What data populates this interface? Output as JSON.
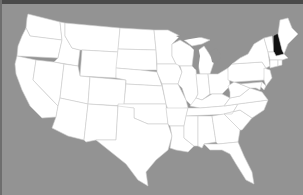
{
  "map": {
    "title": "United States",
    "background_color": "#939393",
    "land_color": "#ffffff",
    "border_color": "#cfcfcf",
    "highlight_color": "#111111",
    "highlighted_state": "New Hampshire",
    "states": [
      {
        "name": "Washington"
      },
      {
        "name": "Oregon"
      },
      {
        "name": "California"
      },
      {
        "name": "Idaho"
      },
      {
        "name": "Nevada"
      },
      {
        "name": "Montana"
      },
      {
        "name": "Wyoming"
      },
      {
        "name": "Utah"
      },
      {
        "name": "Arizona"
      },
      {
        "name": "Colorado"
      },
      {
        "name": "New Mexico"
      },
      {
        "name": "North Dakota"
      },
      {
        "name": "South Dakota"
      },
      {
        "name": "Nebraska"
      },
      {
        "name": "Kansas"
      },
      {
        "name": "Oklahoma"
      },
      {
        "name": "Texas"
      },
      {
        "name": "Minnesota"
      },
      {
        "name": "Iowa"
      },
      {
        "name": "Missouri"
      },
      {
        "name": "Arkansas"
      },
      {
        "name": "Louisiana"
      },
      {
        "name": "Wisconsin"
      },
      {
        "name": "Illinois"
      },
      {
        "name": "Michigan"
      },
      {
        "name": "Indiana"
      },
      {
        "name": "Ohio"
      },
      {
        "name": "Kentucky"
      },
      {
        "name": "Tennessee"
      },
      {
        "name": "Mississippi"
      },
      {
        "name": "Alabama"
      },
      {
        "name": "Georgia"
      },
      {
        "name": "Florida"
      },
      {
        "name": "South Carolina"
      },
      {
        "name": "North Carolina"
      },
      {
        "name": "Virginia"
      },
      {
        "name": "West Virginia"
      },
      {
        "name": "Pennsylvania"
      },
      {
        "name": "New York"
      },
      {
        "name": "Vermont"
      },
      {
        "name": "New Hampshire"
      },
      {
        "name": "Maine"
      },
      {
        "name": "Massachusetts"
      },
      {
        "name": "Connecticut"
      },
      {
        "name": "Rhode Island"
      },
      {
        "name": "New Jersey"
      },
      {
        "name": "Delaware"
      },
      {
        "name": "Maryland"
      }
    ]
  }
}
